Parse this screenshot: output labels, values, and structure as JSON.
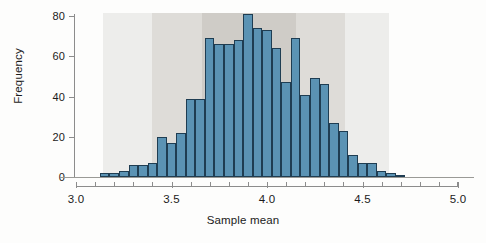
{
  "chart_data": {
    "type": "bar",
    "subtype": "histogram",
    "title": "",
    "xlabel": "Sample mean",
    "ylabel": "Frequency",
    "xlim": [
      3.0,
      5.0
    ],
    "ylim": [
      0,
      80
    ],
    "grid": false,
    "legend": null,
    "bin_width": 0.05,
    "bin_start": 3.125,
    "x_ticks": [
      "3.0",
      "3.5",
      "4.0",
      "4.5",
      "5.0"
    ],
    "x_tick_values": [
      3.0,
      3.5,
      4.0,
      4.5,
      5.0
    ],
    "x_minor_tick_values": [
      3.1,
      3.2,
      3.3,
      3.4,
      3.6,
      3.7,
      3.8,
      3.9,
      4.1,
      4.2,
      4.3,
      4.4,
      4.6,
      4.7,
      4.8,
      4.9
    ],
    "y_ticks": [
      "0",
      "20",
      "40",
      "60",
      "80"
    ],
    "y_tick_values": [
      0,
      20,
      40,
      60,
      80
    ],
    "bin_centers": [
      3.15,
      3.2,
      3.25,
      3.3,
      3.35,
      3.4,
      3.45,
      3.5,
      3.55,
      3.6,
      3.65,
      3.7,
      3.75,
      3.8,
      3.85,
      3.9,
      3.95,
      4.0,
      4.05,
      4.1,
      4.15,
      4.2,
      4.25,
      4.3,
      4.35,
      4.4,
      4.45,
      4.5,
      4.55,
      4.6,
      4.65,
      4.7
    ],
    "categories": [
      "3.15",
      "3.20",
      "3.25",
      "3.30",
      "3.35",
      "3.40",
      "3.45",
      "3.50",
      "3.55",
      "3.60",
      "3.65",
      "3.70",
      "3.75",
      "3.80",
      "3.85",
      "3.90",
      "3.95",
      "4.00",
      "4.05",
      "4.10",
      "4.15",
      "4.20",
      "4.25",
      "4.30",
      "4.35",
      "4.40",
      "4.45",
      "4.50",
      "4.55",
      "4.60",
      "4.65",
      "4.70"
    ],
    "values": [
      2,
      2,
      3,
      6,
      6,
      7,
      20,
      17,
      22,
      39,
      39,
      69,
      66,
      66,
      68,
      81,
      74,
      73,
      64,
      47,
      69,
      41,
      49,
      46,
      27,
      23,
      11,
      7,
      7,
      3,
      2,
      1
    ],
    "bar_color": "#5b93b4",
    "bar_edge_color": "#1f3d52",
    "bands": [
      {
        "name": "three-sigma-band",
        "from": 3.14,
        "to": 4.64,
        "color": "#ededeb"
      },
      {
        "name": "two-sigma-band",
        "from": 3.4,
        "to": 4.41,
        "color": "#dedcd8"
      },
      {
        "name": "one-sigma-band",
        "from": 3.66,
        "to": 4.15,
        "color": "#cfccc7"
      }
    ]
  },
  "axes": {
    "y_title": "Frequency",
    "x_title": "Sample mean"
  },
  "colors": {
    "bar_fill": "#5b93b4",
    "bar_stroke": "#1f3d52",
    "axis": "#8c8c8c",
    "text": "#1b1b1b",
    "background": "#fdfdfc"
  }
}
